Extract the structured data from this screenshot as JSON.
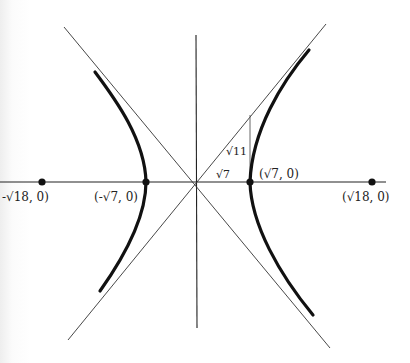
{
  "diagram": {
    "equation_hint": "x^2/7 - y^2/11 = 1",
    "labels": {
      "left_focus": "(-√18, 0)",
      "left_focus_visible": "-√18, 0)",
      "left_vertex": "(-√7, 0)",
      "right_vertex": "(√7, 0)",
      "right_focus": "(√18, 0)",
      "triangle_base": "√7",
      "triangle_height": "√11"
    },
    "points": [
      {
        "name": "left-focus",
        "x": 42,
        "y": 182
      },
      {
        "name": "left-vertex",
        "x": 146,
        "y": 182
      },
      {
        "name": "right-vertex",
        "x": 250,
        "y": 182
      },
      {
        "name": "right-focus",
        "x": 372,
        "y": 182
      }
    ],
    "colors": {
      "ink": "#111111",
      "thin": "#333333"
    }
  }
}
